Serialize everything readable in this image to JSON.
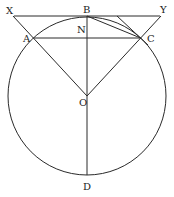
{
  "diagram": {
    "type": "circle-geometry",
    "labels": {
      "X": "X",
      "B": "B",
      "Y": "Y",
      "A": "A",
      "N": "N",
      "C": "C",
      "O": "O",
      "D": "D"
    },
    "points": {
      "X": [
        13,
        16
      ],
      "B": [
        87,
        16
      ],
      "Y": [
        161,
        16
      ],
      "A": [
        33.4,
        38
      ],
      "N": [
        87,
        38
      ],
      "C": [
        140.6,
        38
      ],
      "O": [
        87,
        96
      ],
      "D": [
        87,
        175
      ]
    },
    "circle": {
      "center": "O",
      "radius": 79
    },
    "segments": [
      "XY",
      "AC",
      "BD",
      "XO",
      "YO",
      "BC",
      "tangent-at-C"
    ]
  }
}
